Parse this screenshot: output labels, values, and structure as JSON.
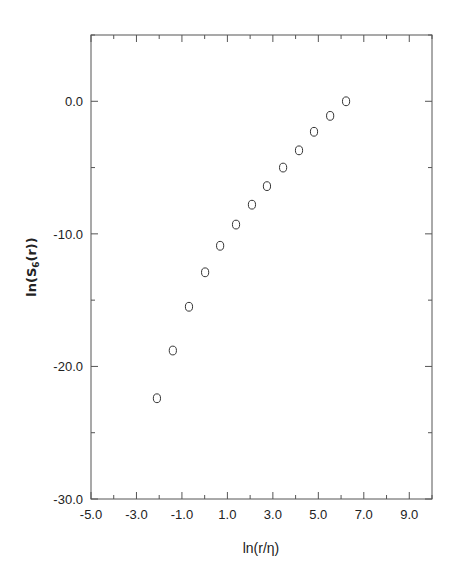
{
  "chart_data": {
    "type": "scatter",
    "title": "",
    "xlabel": "ln(r/η)",
    "ylabel": "ln(S6(r))",
    "ylabel_parts": {
      "prefix": "ln(S",
      "subscript": "6",
      "suffix": "(r))"
    },
    "xlim": [
      -5.0,
      10.0
    ],
    "ylim": [
      -30.0,
      5.0
    ],
    "x_ticks": [
      -5.0,
      -3.0,
      -1.0,
      1.0,
      3.0,
      5.0,
      7.0,
      9.0
    ],
    "x_tick_labels": [
      "-5.0",
      "-3.0",
      "-1.0",
      "1.0",
      "3.0",
      "5.0",
      "7.0",
      "9.0"
    ],
    "y_ticks": [
      0.0,
      -10.0,
      -20.0,
      -30.0
    ],
    "y_tick_labels": [
      "0.0",
      "-10.0",
      "-20.0",
      "-30.0"
    ],
    "grid": false,
    "legend": null,
    "marker": "open-circle",
    "series": [
      {
        "name": "S6",
        "x": [
          -2.1,
          -1.4,
          -0.69,
          0.02,
          0.68,
          1.38,
          2.08,
          2.74,
          3.45,
          4.15,
          4.81,
          5.52,
          6.22
        ],
        "y": [
          -22.4,
          -18.8,
          -15.5,
          -12.9,
          -10.9,
          -9.3,
          -7.8,
          -6.4,
          -5.0,
          -3.7,
          -2.3,
          -1.1,
          0.0
        ]
      }
    ]
  },
  "colors": {
    "axis": "#555555",
    "marker": "#333333",
    "text": "#222222"
  }
}
